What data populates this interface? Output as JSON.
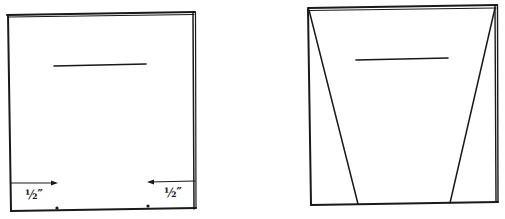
{
  "figure": {
    "panels": [
      {
        "name": "left-panel",
        "labels": [
          "½″",
          "½″"
        ]
      },
      {
        "name": "right-panel",
        "labels": []
      }
    ],
    "colors": {
      "ink": "#1a1a1a",
      "background": "#ffffff"
    }
  }
}
